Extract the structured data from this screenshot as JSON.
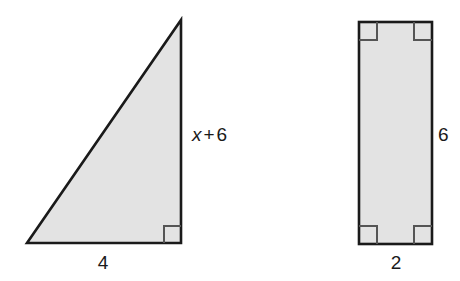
{
  "figure": {
    "background_color": "#ffffff",
    "stroke_color": "#1a1a1a",
    "fill_color": "#e3e3e3",
    "label_color": "#1a1a1a",
    "shapes": [
      {
        "name": "right-triangle",
        "type": "triangle",
        "vertices": [
          [
            27,
            243
          ],
          [
            181,
            243
          ],
          [
            181,
            20
          ]
        ],
        "right_angle_at": [
          181,
          243
        ],
        "labels": {
          "base": "4",
          "height_expression": "x + 6",
          "height_variable": "x",
          "height_operator": "+",
          "height_constant": "6"
        }
      },
      {
        "name": "rectangle",
        "type": "rectangle",
        "x": 359,
        "y": 22,
        "width": 73,
        "height": 222,
        "right_angle_corners": 4,
        "labels": {
          "width": "2",
          "height": "6"
        }
      }
    ],
    "annotations": [
      {
        "name": "triangle-base-label",
        "text": "4",
        "x": 103,
        "y": 262
      },
      {
        "name": "triangle-height-label",
        "variable": "x",
        "operator": "+",
        "constant": "6",
        "x": 192,
        "y": 134
      },
      {
        "name": "rectangle-width-label",
        "text": "2",
        "x": 396,
        "y": 262
      },
      {
        "name": "rectangle-height-label",
        "text": "6",
        "x": 444,
        "y": 134
      }
    ]
  }
}
